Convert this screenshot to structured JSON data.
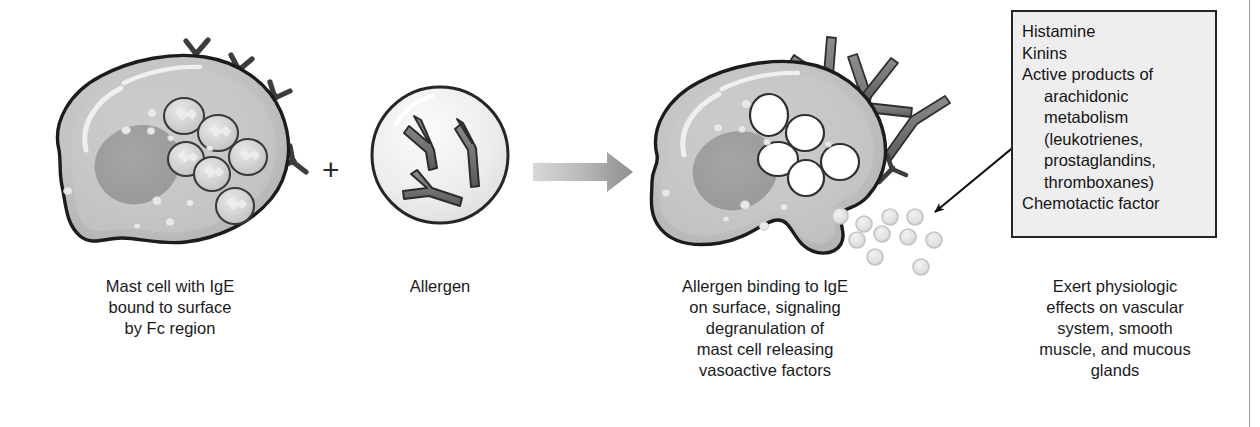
{
  "figure": {
    "background": "#ffffff",
    "accent_dark": "#4a4a4a",
    "cell_fill": "#bdbdbd",
    "cell_fill_inner": "#c8c8c8",
    "nucleus_fill": "#9a9a9a",
    "outline": "#1a1a1a",
    "granule_fill": "#d9d9d9",
    "panel_fill": "#eeeeee",
    "arrow_gray": "#8c8c8c"
  },
  "steps": [
    {
      "id": "mast-cell-resting",
      "caption": "Mast cell with IgE\nbound to surface\nby Fc region",
      "granule_count": 6,
      "ige_receptor_count": 4,
      "state": "resting"
    },
    {
      "id": "allergen",
      "caption": "Allergen",
      "antibody_count": 3,
      "state": "free"
    },
    {
      "id": "mast-cell-degranulating",
      "caption": "Allergen binding to IgE\non surface, signaling\ndegranulation of\nmast cell releasing\nvasoactive factors",
      "vacuole_count": 5,
      "released_granule_count": 10,
      "state": "degranulating"
    },
    {
      "id": "mediators",
      "caption": "Exert physiologic\neffects on vascular\nsystem, smooth\nmuscle, and mucous\nglands",
      "state": "effects"
    }
  ],
  "operator": {
    "plus_symbol": "+"
  },
  "panel": {
    "name": "mediators-panel",
    "items": [
      {
        "text": "Histamine",
        "indent": false
      },
      {
        "text": "Kinins",
        "indent": false
      },
      {
        "text": "Active products of",
        "indent": false
      },
      {
        "text": "arachidonic",
        "indent": true
      },
      {
        "text": "metabolism",
        "indent": true
      },
      {
        "text": "(leukotrienes,",
        "indent": true
      },
      {
        "text": "prostaglandins,",
        "indent": true
      },
      {
        "text": "thromboxanes)",
        "indent": true
      },
      {
        "text": "Chemotactic factor",
        "indent": false
      }
    ]
  }
}
